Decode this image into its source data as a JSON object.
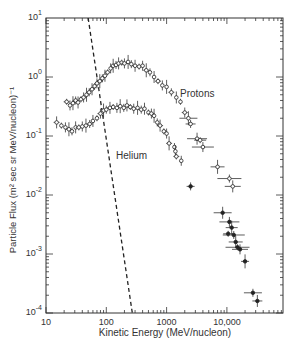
{
  "chart_data": {
    "type": "scatter",
    "title": "",
    "xlabel": "Kinetic Energy (MeV/nucleon)",
    "ylabel": "Particle Flux (m² sec sr MeV/nucleon)⁻¹",
    "xscale": "log",
    "yscale": "log",
    "xlim": [
      10,
      70000
    ],
    "ylim": [
      0.0001,
      10
    ],
    "x_ticks": [
      {
        "value": 10,
        "label": "10"
      },
      {
        "value": 100,
        "label": "100"
      },
      {
        "value": 1000,
        "label": "1000"
      },
      {
        "value": 10000,
        "label": "10,000"
      }
    ],
    "y_ticks": [
      {
        "value": 10,
        "base": "10",
        "exp": "1"
      },
      {
        "value": 1,
        "base": "10",
        "exp": "0"
      },
      {
        "value": 0.1,
        "base": "10",
        "exp": "-1"
      },
      {
        "value": 0.01,
        "base": "10",
        "exp": "-2"
      },
      {
        "value": 0.001,
        "base": "10",
        "exp": "-3"
      },
      {
        "value": 0.0001,
        "base": "10",
        "exp": "-4"
      }
    ],
    "grid": false,
    "legend": null,
    "annotations": [
      {
        "text": "Protons",
        "x": 900,
        "y": 1.3
      },
      {
        "text": "Helium",
        "x": 110,
        "y": 0.085
      }
    ],
    "series": [
      {
        "name": "Protons",
        "marker": "open-circle-with-errorbars",
        "points": [
          [
            22,
            0.38
          ],
          [
            25,
            0.33
          ],
          [
            28,
            0.36
          ],
          [
            31,
            0.4
          ],
          [
            34,
            0.37
          ],
          [
            38,
            0.42
          ],
          [
            42,
            0.45
          ],
          [
            47,
            0.5
          ],
          [
            52,
            0.55
          ],
          [
            58,
            0.62
          ],
          [
            64,
            0.7
          ],
          [
            70,
            0.78
          ],
          [
            78,
            0.85
          ],
          [
            86,
            0.95
          ],
          [
            95,
            1.05
          ],
          [
            105,
            1.2
          ],
          [
            118,
            1.4
          ],
          [
            130,
            1.55
          ],
          [
            145,
            1.6
          ],
          [
            160,
            1.7
          ],
          [
            180,
            1.75
          ],
          [
            200,
            1.7
          ],
          [
            230,
            1.8
          ],
          [
            260,
            1.65
          ],
          [
            300,
            1.55
          ],
          [
            350,
            1.5
          ],
          [
            400,
            1.55
          ],
          [
            460,
            1.3
          ],
          [
            530,
            1.2
          ],
          [
            620,
            1.0
          ],
          [
            720,
            0.85
          ],
          [
            850,
            0.72
          ],
          [
            1000,
            0.68
          ],
          [
            1200,
            0.55
          ],
          [
            1450,
            0.45
          ],
          [
            1700,
            0.38
          ],
          [
            2000,
            0.25
          ],
          [
            2300,
            0.2
          ],
          [
            2500,
            0.16
          ],
          [
            3200,
            0.09
          ],
          [
            3600,
            0.085
          ],
          [
            4000,
            0.065
          ],
          [
            7000,
            0.03
          ],
          [
            11000,
            0.019
          ],
          [
            12500,
            0.014
          ]
        ]
      },
      {
        "name": "Helium",
        "marker": "open-circle-with-errorbars",
        "points": [
          [
            15,
            0.17
          ],
          [
            18,
            0.15
          ],
          [
            21,
            0.14
          ],
          [
            24,
            0.13
          ],
          [
            27,
            0.12
          ],
          [
            31,
            0.14
          ],
          [
            35,
            0.14
          ],
          [
            40,
            0.145
          ],
          [
            46,
            0.15
          ],
          [
            53,
            0.16
          ],
          [
            60,
            0.18
          ],
          [
            70,
            0.2
          ],
          [
            80,
            0.24
          ],
          [
            90,
            0.27
          ],
          [
            100,
            0.28
          ],
          [
            115,
            0.3
          ],
          [
            130,
            0.31
          ],
          [
            150,
            0.3
          ],
          [
            170,
            0.32
          ],
          [
            195,
            0.3
          ],
          [
            220,
            0.33
          ],
          [
            250,
            0.31
          ],
          [
            285,
            0.29
          ],
          [
            330,
            0.3
          ],
          [
            380,
            0.28
          ],
          [
            430,
            0.29
          ],
          [
            500,
            0.25
          ],
          [
            560,
            0.24
          ],
          [
            620,
            0.22
          ],
          [
            700,
            0.17
          ],
          [
            780,
            0.15
          ],
          [
            900,
            0.12
          ],
          [
            1000,
            0.11
          ],
          [
            1100,
            0.075
          ],
          [
            1350,
            0.065
          ],
          [
            1400,
            0.055
          ],
          [
            1450,
            0.045
          ],
          [
            1750,
            0.038
          ]
        ]
      },
      {
        "name": "High-energy flux (combined)",
        "marker": "filled-circle-with-errorbars",
        "points": [
          [
            2500,
            0.014
          ],
          [
            8500,
            0.005
          ],
          [
            10500,
            0.0022
          ],
          [
            11000,
            0.0035
          ],
          [
            12000,
            0.0028
          ],
          [
            13000,
            0.0021
          ],
          [
            14000,
            0.0016
          ],
          [
            15000,
            0.0013
          ],
          [
            16500,
            0.0012
          ],
          [
            20000,
            0.00075
          ],
          [
            27000,
            0.00022
          ],
          [
            32000,
            0.00016
          ]
        ]
      }
    ],
    "reference_line": {
      "style": "dashed",
      "description": "steep falling dashed line",
      "points": [
        [
          50,
          10
        ],
        [
          270,
          0.0001
        ]
      ]
    }
  }
}
